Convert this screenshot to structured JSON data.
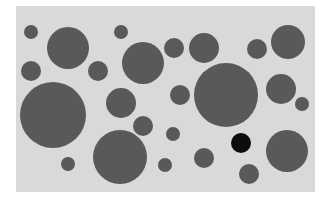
{
  "figure": {
    "background_color": "#ffffff",
    "panel_color": "#d9d9d9",
    "circle_color": "#595959",
    "highlight_color": "#0d0d0d",
    "circles": [
      {
        "cx": 31,
        "cy": 32,
        "r": 7,
        "highlight": false
      },
      {
        "cx": 68,
        "cy": 48,
        "r": 21,
        "highlight": false
      },
      {
        "cx": 31,
        "cy": 71,
        "r": 10,
        "highlight": false
      },
      {
        "cx": 98,
        "cy": 71,
        "r": 10,
        "highlight": false
      },
      {
        "cx": 121,
        "cy": 32,
        "r": 7,
        "highlight": false
      },
      {
        "cx": 143,
        "cy": 63,
        "r": 21,
        "highlight": false
      },
      {
        "cx": 174,
        "cy": 48,
        "r": 10,
        "highlight": false
      },
      {
        "cx": 204,
        "cy": 48,
        "r": 15,
        "highlight": false
      },
      {
        "cx": 257,
        "cy": 49,
        "r": 10,
        "highlight": false
      },
      {
        "cx": 288,
        "cy": 42,
        "r": 17,
        "highlight": false
      },
      {
        "cx": 53,
        "cy": 115,
        "r": 33,
        "highlight": false
      },
      {
        "cx": 121,
        "cy": 103,
        "r": 15,
        "highlight": false
      },
      {
        "cx": 180,
        "cy": 95,
        "r": 10,
        "highlight": false
      },
      {
        "cx": 226,
        "cy": 95,
        "r": 32,
        "highlight": false
      },
      {
        "cx": 281,
        "cy": 89,
        "r": 15,
        "highlight": false
      },
      {
        "cx": 302,
        "cy": 104,
        "r": 7,
        "highlight": false
      },
      {
        "cx": 143,
        "cy": 126,
        "r": 10,
        "highlight": false
      },
      {
        "cx": 173,
        "cy": 134,
        "r": 7,
        "highlight": false
      },
      {
        "cx": 68,
        "cy": 164,
        "r": 7,
        "highlight": false
      },
      {
        "cx": 120,
        "cy": 157,
        "r": 27,
        "highlight": false
      },
      {
        "cx": 165,
        "cy": 165,
        "r": 7,
        "highlight": false
      },
      {
        "cx": 204,
        "cy": 158,
        "r": 10,
        "highlight": false
      },
      {
        "cx": 241,
        "cy": 143,
        "r": 10,
        "highlight": true
      },
      {
        "cx": 287,
        "cy": 151,
        "r": 21,
        "highlight": false
      },
      {
        "cx": 249,
        "cy": 174,
        "r": 10,
        "highlight": false
      }
    ]
  }
}
